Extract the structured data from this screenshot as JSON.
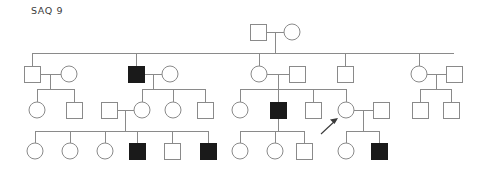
{
  "figure": {
    "title": "SAQ 9",
    "type": "pedigree-chart",
    "width": 498,
    "height": 174,
    "background_color": "#ffffff",
    "line_color": "#8a8a8a",
    "affected_fill": "#1a1a1a",
    "unaffected_fill": "#ffffff",
    "stroke_width": 1,
    "symbol_size": 16,
    "legend": {
      "square": "male",
      "circle": "female",
      "filled": "affected",
      "open": "unaffected",
      "arrow": "proband"
    }
  },
  "generations": [
    {
      "id": "I",
      "y": 32,
      "individuals": [
        {
          "id": "I-1",
          "shape": "square",
          "sex": "male",
          "affected": false,
          "cx": 258,
          "cy": 32
        },
        {
          "id": "I-2",
          "shape": "circle",
          "sex": "female",
          "affected": false,
          "cx": 292,
          "cy": 32
        }
      ]
    },
    {
      "id": "II",
      "y": 74,
      "individuals": [
        {
          "id": "II-1",
          "shape": "square",
          "sex": "male",
          "affected": false,
          "cx": 32,
          "cy": 74
        },
        {
          "id": "II-2",
          "shape": "circle",
          "sex": "female",
          "affected": false,
          "cx": 69,
          "cy": 74
        },
        {
          "id": "II-3",
          "shape": "square",
          "sex": "male",
          "affected": true,
          "cx": 136,
          "cy": 74
        },
        {
          "id": "II-4",
          "shape": "circle",
          "sex": "female",
          "affected": false,
          "cx": 170,
          "cy": 74
        },
        {
          "id": "II-5",
          "shape": "circle",
          "sex": "female",
          "affected": false,
          "cx": 259,
          "cy": 74
        },
        {
          "id": "II-6",
          "shape": "square",
          "sex": "male",
          "affected": false,
          "cx": 297,
          "cy": 74
        },
        {
          "id": "II-7",
          "shape": "square",
          "sex": "male",
          "affected": false,
          "cx": 345,
          "cy": 74
        },
        {
          "id": "II-8",
          "shape": "circle",
          "sex": "female",
          "affected": false,
          "cx": 419,
          "cy": 74
        },
        {
          "id": "II-9",
          "shape": "square",
          "sex": "male",
          "affected": false,
          "cx": 454,
          "cy": 74
        }
      ]
    },
    {
      "id": "III",
      "y": 110,
      "individuals": [
        {
          "id": "III-1",
          "shape": "circle",
          "sex": "female",
          "affected": false,
          "cx": 37,
          "cy": 110
        },
        {
          "id": "III-2",
          "shape": "square",
          "sex": "male",
          "affected": false,
          "cx": 74,
          "cy": 110
        },
        {
          "id": "III-3",
          "shape": "square",
          "sex": "male",
          "affected": false,
          "cx": 109,
          "cy": 110
        },
        {
          "id": "III-4",
          "shape": "circle",
          "sex": "female",
          "affected": false,
          "cx": 142,
          "cy": 110
        },
        {
          "id": "III-5",
          "shape": "circle",
          "sex": "female",
          "affected": false,
          "cx": 173,
          "cy": 110
        },
        {
          "id": "III-6",
          "shape": "square",
          "sex": "male",
          "affected": false,
          "cx": 205,
          "cy": 110
        },
        {
          "id": "III-7",
          "shape": "circle",
          "sex": "female",
          "affected": false,
          "cx": 240,
          "cy": 110
        },
        {
          "id": "III-8",
          "shape": "square",
          "sex": "male",
          "affected": true,
          "cx": 278,
          "cy": 110
        },
        {
          "id": "III-9",
          "shape": "square",
          "sex": "male",
          "affected": false,
          "cx": 313,
          "cy": 110
        },
        {
          "id": "III-10",
          "shape": "circle",
          "sex": "female",
          "affected": false,
          "cx": 346,
          "cy": 110,
          "proband": true
        },
        {
          "id": "III-11",
          "shape": "square",
          "sex": "male",
          "affected": false,
          "cx": 381,
          "cy": 110
        },
        {
          "id": "III-12",
          "shape": "square",
          "sex": "male",
          "affected": false,
          "cx": 420,
          "cy": 110
        },
        {
          "id": "III-13",
          "shape": "square",
          "sex": "male",
          "affected": false,
          "cx": 451,
          "cy": 110
        }
      ]
    },
    {
      "id": "IV",
      "y": 151,
      "individuals": [
        {
          "id": "IV-1",
          "shape": "circle",
          "sex": "female",
          "affected": false,
          "cx": 35,
          "cy": 151
        },
        {
          "id": "IV-2",
          "shape": "circle",
          "sex": "female",
          "affected": false,
          "cx": 70,
          "cy": 151
        },
        {
          "id": "IV-3",
          "shape": "circle",
          "sex": "female",
          "affected": false,
          "cx": 105,
          "cy": 151
        },
        {
          "id": "IV-4",
          "shape": "square",
          "sex": "male",
          "affected": true,
          "cx": 137,
          "cy": 151
        },
        {
          "id": "IV-5",
          "shape": "square",
          "sex": "male",
          "affected": false,
          "cx": 172,
          "cy": 151
        },
        {
          "id": "IV-6",
          "shape": "square",
          "sex": "male",
          "affected": true,
          "cx": 208,
          "cy": 151
        },
        {
          "id": "IV-7",
          "shape": "circle",
          "sex": "female",
          "affected": false,
          "cx": 240,
          "cy": 151
        },
        {
          "id": "IV-8",
          "shape": "circle",
          "sex": "female",
          "affected": false,
          "cx": 275,
          "cy": 151
        },
        {
          "id": "IV-9",
          "shape": "square",
          "sex": "male",
          "affected": false,
          "cx": 304,
          "cy": 151
        },
        {
          "id": "IV-10",
          "shape": "circle",
          "sex": "female",
          "affected": false,
          "cx": 346,
          "cy": 151
        },
        {
          "id": "IV-11",
          "shape": "square",
          "sex": "male",
          "affected": true,
          "cx": 379,
          "cy": 151
        }
      ]
    }
  ],
  "counts": {
    "total_individuals": 35,
    "affected": 5,
    "males": 18,
    "females": 17,
    "generations": 4
  }
}
